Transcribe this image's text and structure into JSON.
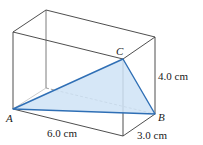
{
  "figure": {
    "type": "rectangular box with inscribed triangle",
    "colors": {
      "edges": "#3a3a3a",
      "triangle_stroke": "#2f6fb5",
      "triangle_fill": "#cfe3f6"
    },
    "vertices": {
      "A": {
        "label": "A"
      },
      "B": {
        "label": "B"
      },
      "C": {
        "label": "C"
      }
    },
    "dimensions": {
      "length": "6.0 cm",
      "width": "3.0 cm",
      "height": "4.0 cm"
    }
  }
}
